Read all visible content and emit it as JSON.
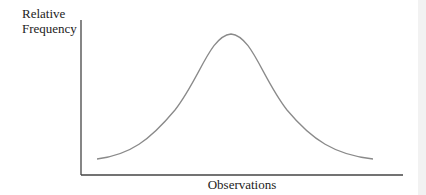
{
  "diagram": {
    "ylabel_line1": "Relative",
    "ylabel_line2": "Frequency",
    "xlabel": "Observations",
    "curve_color": "#8a8a8a",
    "axis_color": "#444444"
  }
}
